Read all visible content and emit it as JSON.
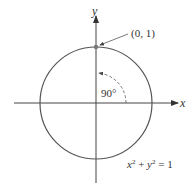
{
  "diagram": {
    "axes": {
      "x_label": "x",
      "y_label": "y"
    },
    "point_label": "(0, 1)",
    "angle_label": "90°",
    "equation": {
      "x": "x",
      "exp1": "2",
      "plus": " + ",
      "y": "y",
      "exp2": "2",
      "rest": " = 1"
    },
    "colors": {
      "circle": "#555555",
      "axis": "#444444",
      "point": "#777777",
      "text": "#333333"
    }
  }
}
